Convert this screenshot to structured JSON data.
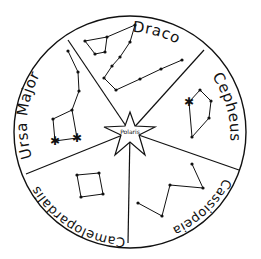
{
  "diagram": {
    "center_label": "Polaris",
    "circle": {
      "cx": 130,
      "cy": 132,
      "r": 116
    },
    "dividers": [
      {
        "x": 68,
        "y": 40
      },
      {
        "x": 204,
        "y": 50
      },
      {
        "x": 239,
        "y": 170
      },
      {
        "x": 128,
        "y": 243
      },
      {
        "x": 26,
        "y": 174
      }
    ],
    "constellations": [
      {
        "name": "Draco",
        "label": "Draco",
        "stars": [
          [
            85,
            41
          ],
          [
            107,
            37
          ],
          [
            135,
            25
          ],
          [
            95,
            54
          ],
          [
            105,
            52
          ],
          [
            130,
            42
          ],
          [
            120,
            57
          ],
          [
            112,
            66
          ],
          [
            104,
            78
          ],
          [
            116,
            90
          ],
          [
            140,
            79
          ],
          [
            161,
            69
          ],
          [
            182,
            60
          ]
        ],
        "lines": [
          [
            [
              85,
              41
            ],
            [
              107,
              37
            ],
            [
              105,
              52
            ],
            [
              95,
              54
            ],
            [
              85,
              41
            ]
          ],
          [
            [
              107,
              37
            ],
            [
              135,
              25
            ],
            [
              130,
              42
            ],
            [
              120,
              57
            ],
            [
              112,
              66
            ],
            [
              104,
              78
            ],
            [
              116,
              90
            ],
            [
              140,
              79
            ],
            [
              161,
              69
            ],
            [
              182,
              60
            ]
          ]
        ]
      },
      {
        "name": "Cepheus",
        "label": "Cepheus",
        "stars": [
          [
            200,
            90
          ],
          [
            211,
            101
          ],
          [
            209,
            118
          ],
          [
            192,
            137
          ],
          [
            189,
            102
          ]
        ],
        "bright_stars": [
          [
            189,
            102
          ]
        ],
        "lines": [
          [
            [
              189,
              102
            ],
            [
              200,
              90
            ],
            [
              211,
              101
            ],
            [
              209,
              118
            ],
            [
              192,
              137
            ],
            [
              189,
              102
            ]
          ]
        ]
      },
      {
        "name": "Cassiopeia",
        "label": "Cassiopeia",
        "stars": [
          [
            192,
            164
          ],
          [
            203,
            188
          ],
          [
            170,
            185
          ],
          [
            162,
            216
          ],
          [
            138,
            203
          ]
        ],
        "lines": [
          [
            [
              192,
              164
            ],
            [
              203,
              188
            ],
            [
              170,
              185
            ],
            [
              162,
              216
            ],
            [
              138,
              203
            ]
          ]
        ]
      },
      {
        "name": "Camelopardalis",
        "label": "Camelopardalis",
        "stars": [
          [
            77,
            175
          ],
          [
            99,
            173
          ],
          [
            103,
            194
          ],
          [
            81,
            197
          ]
        ],
        "lines": [
          [
            [
              77,
              175
            ],
            [
              99,
              173
            ],
            [
              103,
              194
            ],
            [
              81,
              197
            ],
            [
              77,
              175
            ]
          ]
        ]
      },
      {
        "name": "Ursa Major",
        "label": "Ursa Major",
        "stars": [
          [
            68,
            51
          ],
          [
            78,
            72
          ],
          [
            79,
            91
          ],
          [
            72,
            110
          ],
          [
            53,
            119
          ],
          [
            55,
            141
          ],
          [
            77,
            138
          ]
        ],
        "bright_stars": [
          [
            55,
            141
          ],
          [
            77,
            138
          ]
        ],
        "lines": [
          [
            [
              68,
              51
            ],
            [
              78,
              72
            ],
            [
              79,
              91
            ],
            [
              72,
              110
            ],
            [
              53,
              119
            ],
            [
              55,
              141
            ],
            [
              77,
              138
            ],
            [
              72,
              110
            ]
          ]
        ]
      }
    ]
  }
}
